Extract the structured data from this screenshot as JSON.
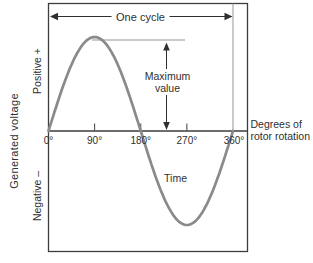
{
  "figure": {
    "one_cycle_label": "One cycle",
    "maximum_value_label": {
      "line1": "Maximum",
      "line2": "value"
    },
    "time_label": "Time",
    "x_axis_title": {
      "line1": "Degrees of",
      "line2": "rotor rotation"
    },
    "y_axis_title": "Generated voltage",
    "positive_label": "Positive +",
    "negative_label": "Negative –"
  },
  "chart_data": {
    "type": "line",
    "title": "One cycle",
    "xlabel": "Degrees of rotor rotation",
    "ylabel": "Generated voltage",
    "x_ticks": [
      0,
      90,
      180,
      270,
      360
    ],
    "x_tick_labels": [
      "0°",
      "90°",
      "180°",
      "270°",
      "360°"
    ],
    "y_range": [
      -1,
      1
    ],
    "grid": false,
    "series": [
      {
        "name": "Generated voltage sine wave",
        "function": "sine",
        "x": [
          0,
          30,
          60,
          90,
          120,
          150,
          180,
          210,
          240,
          270,
          300,
          330,
          360
        ],
        "values": [
          0,
          0.5,
          0.87,
          1,
          0.87,
          0.5,
          0,
          -0.5,
          -0.87,
          -1,
          -0.87,
          -0.5,
          0
        ]
      }
    ],
    "annotations": [
      "One cycle",
      "Maximum value",
      "Time",
      "Positive +",
      "Negative –"
    ]
  },
  "colors": {
    "curve": "#8a8a8a",
    "line_dark": "#3d3d3d",
    "line_thin": "#959595",
    "arrow": "#2f2f2f",
    "text": "#2f2f2f",
    "background": "#ffffff"
  }
}
